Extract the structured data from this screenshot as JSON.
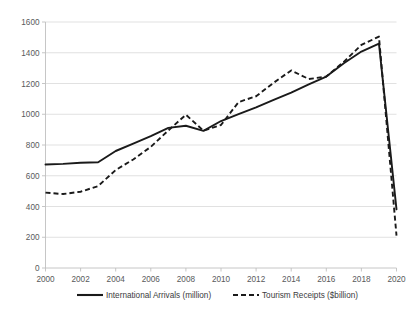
{
  "chart_data": {
    "type": "line",
    "title": "",
    "subtitle": "",
    "xlabel": "",
    "ylabel": "",
    "xlim": [
      2000,
      2020
    ],
    "ylim": [
      0,
      1600
    ],
    "grid": true,
    "legend_position": "bottom",
    "x": [
      2000,
      2001,
      2002,
      2003,
      2004,
      2005,
      2006,
      2007,
      2008,
      2009,
      2010,
      2011,
      2012,
      2013,
      2014,
      2015,
      2016,
      2017,
      2018,
      2019,
      2020
    ],
    "xtick_labels": [
      "2000",
      "2002",
      "2004",
      "2006",
      "2008",
      "2010",
      "2012",
      "2014",
      "2016",
      "2018",
      "2020"
    ],
    "xtick_values": [
      2000,
      2002,
      2004,
      2006,
      2008,
      2010,
      2012,
      2014,
      2016,
      2018,
      2020
    ],
    "ytick_labels": [
      "0",
      "200",
      "400",
      "600",
      "800",
      "1000",
      "1200",
      "1400",
      "1600"
    ],
    "ytick_values": [
      0,
      200,
      400,
      600,
      800,
      1000,
      1200,
      1400,
      1600
    ],
    "series": [
      {
        "name": "International Arrivals (million)",
        "style": "solid",
        "color": "#1a1a1a",
        "values": [
          673,
          677,
          685,
          688,
          761,
          809,
          858,
          911,
          925,
          892,
          956,
          1001,
          1045,
          1093,
          1141,
          1194,
          1245,
          1332,
          1408,
          1460,
          381
        ]
      },
      {
        "name": "Tourism Receipts ($billion)",
        "style": "dashed",
        "color": "#1a1a1a",
        "values": [
          490,
          481,
          496,
          533,
          637,
          706,
          788,
          895,
          997,
          893,
          930,
          1079,
          1117,
          1205,
          1285,
          1229,
          1245,
          1341,
          1451,
          1505,
          211
        ]
      }
    ]
  },
  "legend": {
    "items": [
      {
        "label": "International Arrivals (million)",
        "style": "solid"
      },
      {
        "label": "Tourism Receipts ($billion)",
        "style": "dashed"
      }
    ]
  }
}
